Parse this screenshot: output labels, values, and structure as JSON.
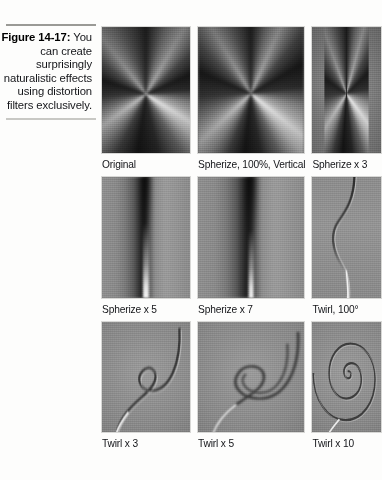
{
  "figure": {
    "label": "Figure 14-17:",
    "caption": "You can create surprisingly naturalistic effects using distortion filters exclusively."
  },
  "grid": {
    "rows": [
      {
        "cells": [
          {
            "label": "Original",
            "art": "cone"
          },
          {
            "label": "Spherize, 100%, Vertical",
            "art": "cone-squeeze-2"
          },
          {
            "label": "Spherize x 3",
            "art": "cone-squeeze-3"
          }
        ]
      },
      {
        "cells": [
          {
            "label": "Spherize x 5",
            "art": "smear-5"
          },
          {
            "label": "Spherize x 7",
            "art": "smear-7"
          },
          {
            "label": "Twirl, 100°",
            "art": "twirl-bend"
          }
        ]
      },
      {
        "cells": [
          {
            "label": "Twirl x 3",
            "art": "spiral-3"
          },
          {
            "label": "Twirl x 5",
            "art": "spiral-5"
          },
          {
            "label": "Twirl x 10",
            "art": "spiral-10"
          }
        ]
      }
    ]
  },
  "colors": {
    "page_background": "#ffffff",
    "rule_top": "#9a9a96",
    "rule_bottom": "#c8c8c4",
    "text": "#15161a",
    "panel_midtone": "#8c8c8c"
  }
}
